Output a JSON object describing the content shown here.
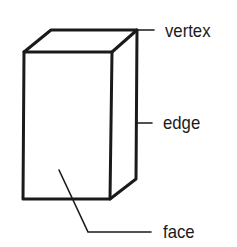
{
  "diagram": {
    "stroke_color": "#1a1a1a",
    "labels": [
      {
        "id": "vertex",
        "text": "vertex"
      },
      {
        "id": "edge",
        "text": "edge"
      },
      {
        "id": "face",
        "text": "face"
      }
    ]
  }
}
